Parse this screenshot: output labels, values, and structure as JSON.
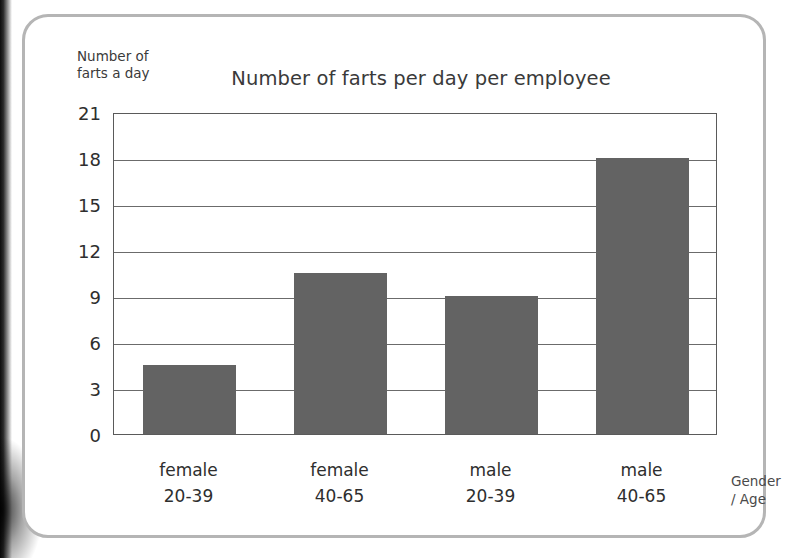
{
  "page": {
    "background_color": "#ffffff",
    "card_border_color": "#b5b5b5"
  },
  "chart_data": {
    "type": "bar",
    "title": "Number of farts per day per employee",
    "xlabel": "Gender\n/ Age",
    "ylabel": "Number of\nfarts a day",
    "categories": [
      "female\n20-39",
      "female\n40-65",
      "male\n20-39",
      "male\n40-65"
    ],
    "category_gender": [
      "female",
      "female",
      "male",
      "male"
    ],
    "category_age": [
      "20-39",
      "40-65",
      "20-39",
      "40-65"
    ],
    "values": [
      4.5,
      10.5,
      9,
      18
    ],
    "ylim": [
      0,
      21
    ],
    "yticks": [
      0,
      3,
      6,
      9,
      12,
      15,
      18,
      21
    ],
    "ytick_labels": [
      "0",
      "3",
      "6",
      "9",
      "12",
      "15",
      "18",
      "21"
    ],
    "grid": true,
    "legend": false,
    "bar_color": "#636363",
    "grid_color": "#6b6b6b",
    "axis_color": "#5a5a5a"
  }
}
